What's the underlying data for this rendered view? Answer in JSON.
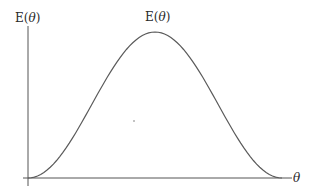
{
  "chart_data": {
    "type": "line",
    "title": "",
    "xlabel": "θ",
    "ylabel": "E(θ)",
    "curve_label": "E(θ)",
    "grid": false,
    "legend": null,
    "x_ticks": [],
    "y_ticks": [],
    "series": [
      {
        "name": "E(θ)",
        "shape": "bell-shaped (smooth hump)",
        "x": [
          0.0,
          0.1,
          0.2,
          0.3,
          0.4,
          0.5,
          0.6,
          0.7,
          0.8,
          0.9,
          1.0
        ],
        "values": [
          0.0,
          0.09,
          0.33,
          0.65,
          0.91,
          1.0,
          0.91,
          0.65,
          0.33,
          0.09,
          0.0
        ]
      }
    ],
    "annotations": [
      "small dot near the center of the plot area"
    ],
    "colors": {
      "axis": "#555555",
      "curve": "#5a5a5a",
      "text": "#2a2a2a"
    }
  },
  "labels": {
    "y_axis": "E(",
    "y_axis_var": "θ",
    "y_axis_close": ")",
    "curve": "E(",
    "curve_var": "θ",
    "curve_close": ")",
    "x_axis": "θ"
  }
}
